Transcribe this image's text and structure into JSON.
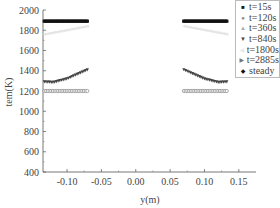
{
  "chart_data": {
    "type": "scatter",
    "title": "",
    "xlabel": "y(m)",
    "ylabel": "tem(K)",
    "xlim": [
      -0.135,
      0.175
    ],
    "ylim": [
      400,
      2000
    ],
    "xticks": [
      -0.1,
      -0.05,
      0.0,
      0.05,
      0.1,
      0.15
    ],
    "xtick_labels": [
      "-0.10",
      "-0.05",
      "0.00",
      "0.05",
      "0.10",
      "0.15"
    ],
    "yticks": [
      400,
      600,
      800,
      1000,
      1200,
      1400,
      1600,
      1800,
      2000
    ],
    "ytick_labels": [
      "400",
      "600",
      "800",
      "1000",
      "1200",
      "1400",
      "1600",
      "1800",
      "2000"
    ],
    "grid": false,
    "legend_position": "upper right",
    "series": [
      {
        "name": "t=15s",
        "marker": "square",
        "color": "#1a1a1a",
        "x": [
          -0.133,
          -0.07,
          0.07,
          0.133
        ],
        "y": [
          1890,
          1890,
          1890,
          1890
        ]
      },
      {
        "name": "t=120s",
        "marker": "circle",
        "color": "#888888",
        "x": [
          -0.133,
          -0.07,
          0.07,
          0.133
        ],
        "y": [
          1200,
          1200,
          1200,
          1200
        ]
      },
      {
        "name": "t=360s",
        "marker": "triangle-up",
        "color": "#aaaaaa",
        "x": [
          -0.133,
          -0.07,
          0.07,
          0.133
        ],
        "y": [
          1890,
          1890,
          1890,
          1890
        ]
      },
      {
        "name": "t=840s",
        "marker": "triangle-down",
        "color": "#444444",
        "x": [
          -0.133,
          -0.12,
          -0.1,
          -0.08,
          -0.07,
          0.07,
          0.08,
          0.1,
          0.12,
          0.133
        ],
        "y": [
          1290,
          1285,
          1320,
          1380,
          1410,
          1410,
          1380,
          1320,
          1285,
          1290
        ]
      },
      {
        "name": "t=1800s",
        "marker": "triangle-left",
        "color": "#e4e4e4",
        "x": [
          -0.133,
          -0.07,
          0.07,
          0.133
        ],
        "y": [
          1760,
          1840,
          1840,
          1760
        ]
      },
      {
        "name": "t=2885s",
        "marker": "triangle-right",
        "color": "#777777",
        "x": [
          -0.133,
          -0.07,
          0.07,
          0.133
        ],
        "y": [
          1890,
          1890,
          1890,
          1890
        ]
      },
      {
        "name": "steady",
        "marker": "diamond",
        "color": "#111111",
        "x": [
          -0.133,
          -0.07,
          0.07,
          0.133
        ],
        "y": [
          1890,
          1890,
          1890,
          1890
        ]
      }
    ]
  },
  "legend": {
    "items": [
      {
        "mark": "■",
        "label": "t=15s"
      },
      {
        "mark": "●",
        "label": "t=120s"
      },
      {
        "mark": "▲",
        "label": "t=360s"
      },
      {
        "mark": "▼",
        "label": "t=840s"
      },
      {
        "mark": "◀",
        "label": "t=1800s"
      },
      {
        "mark": "▶",
        "label": "t=2885s"
      },
      {
        "mark": "◆",
        "label": "steady"
      }
    ]
  }
}
